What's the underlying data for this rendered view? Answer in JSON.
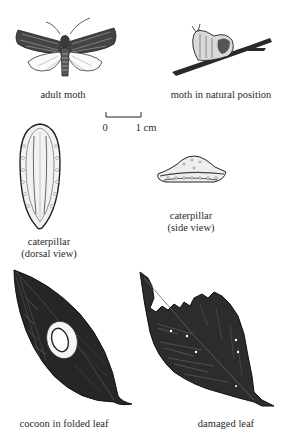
{
  "figure": {
    "panels": [
      {
        "id": "adult-moth",
        "caption": "adult moth"
      },
      {
        "id": "moth-natural-position",
        "caption": "moth in natural position"
      },
      {
        "id": "caterpillar-dorsal",
        "caption_line1": "caterpillar",
        "caption_line2": "(dorsal view)"
      },
      {
        "id": "caterpillar-side",
        "caption_line1": "caterpillar",
        "caption_line2": "(side view)"
      },
      {
        "id": "cocoon-folded-leaf",
        "caption": "cocoon in folded leaf"
      },
      {
        "id": "damaged-leaf",
        "caption": "damaged leaf"
      }
    ],
    "scale_bar": {
      "start_label": "0",
      "end_label": "1 cm"
    }
  },
  "colors": {
    "ink": "#1e1e1e",
    "paper": "#ffffff",
    "midtone": "#555555"
  }
}
